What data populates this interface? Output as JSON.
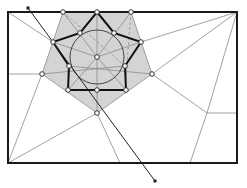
{
  "diagram": {
    "type": "geometric-construction",
    "colors": {
      "background": "#ffffff",
      "frame": "#1a1a1a",
      "fill_region": "#d4d4d4",
      "thin_line": "#8a8a8a",
      "star_line": "#111111",
      "dashed_line": "#9a9a9a",
      "marker_fill": "#ffffff",
      "marker_stroke": "#333333"
    },
    "frame": {
      "x1": 8,
      "y1": 12,
      "x2": 237,
      "y2": 163
    },
    "circle": {
      "cx": 97,
      "cy": 57,
      "r": 27
    },
    "outer_polygon": [
      [
        63,
        12
      ],
      [
        131,
        12
      ],
      [
        152,
        74
      ],
      [
        97,
        113
      ],
      [
        42,
        74
      ]
    ],
    "star": {
      "outer_points": [
        [
          97,
          12
        ],
        [
          141,
          42
        ],
        [
          126,
          90
        ],
        [
          68,
          90
        ],
        [
          53,
          42
        ]
      ],
      "inner_points": [
        [
          114,
          33
        ],
        [
          125,
          66
        ],
        [
          97,
          90
        ],
        [
          69,
          66
        ],
        [
          80,
          33
        ]
      ]
    },
    "arrow": {
      "x1": 28,
      "y1": 8,
      "x2": 155,
      "y2": 181
    },
    "markers": [
      [
        63,
        12
      ],
      [
        97,
        12
      ],
      [
        131,
        12
      ],
      [
        53,
        42
      ],
      [
        141,
        42
      ],
      [
        42,
        74
      ],
      [
        152,
        74
      ],
      [
        68,
        90
      ],
      [
        126,
        90
      ],
      [
        97,
        113
      ],
      [
        97,
        57
      ],
      [
        80,
        33
      ],
      [
        114,
        33
      ],
      [
        69,
        66
      ],
      [
        125,
        66
      ],
      [
        97,
        90
      ]
    ]
  }
}
